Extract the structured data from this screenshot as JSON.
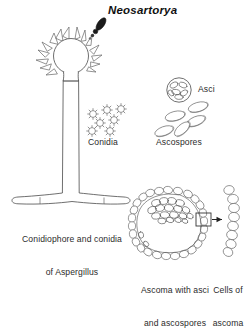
{
  "figure": {
    "title": "Neosartorya",
    "title_style": "bold-italic",
    "background_color": "#ffffff",
    "ink_color": "#4a4a4a",
    "dark_spore_color": "#1b1b1b",
    "width": 250,
    "height": 296,
    "kind": "scientific-line-drawing"
  },
  "labels": {
    "conidia": "Conidia",
    "asci": "Asci",
    "ascospores": "Ascospores",
    "conidiophore_line1": "Conidiophore and conidia",
    "conidiophore_line2_prefix": "of ",
    "conidiophore_line2_italic": "Aspergillus",
    "ascoma_line1": "Ascoma with asci",
    "ascoma_line2": "and ascospores",
    "cells_line1": "Cells of",
    "cells_line2": "ascoma"
  },
  "structures": {
    "conidiophore": {
      "name": "conidiophore",
      "parts": [
        "vesicle",
        "phialides",
        "stalk",
        "foot-cell",
        "conidial-chain"
      ],
      "vesicle_center": [
        71,
        55
      ],
      "vesicle_radius": 17,
      "stalk_top": 70,
      "stalk_bottom": 198,
      "phialide_count": 14
    },
    "conidia_cluster": {
      "name": "conidia",
      "count": 7,
      "shape": "echinulate-spherical"
    },
    "ascus": {
      "name": "ascus",
      "count": 1,
      "contains": "ascospores",
      "center": [
        178,
        90
      ],
      "radius": 12
    },
    "ascospores_cluster": {
      "name": "ascospores",
      "count": 5,
      "shape": "lenticular"
    },
    "ascoma": {
      "name": "ascoma",
      "wall": "chained-cells",
      "contents": "asci-and-ascospores",
      "callout": "cells-of-ascoma"
    }
  }
}
